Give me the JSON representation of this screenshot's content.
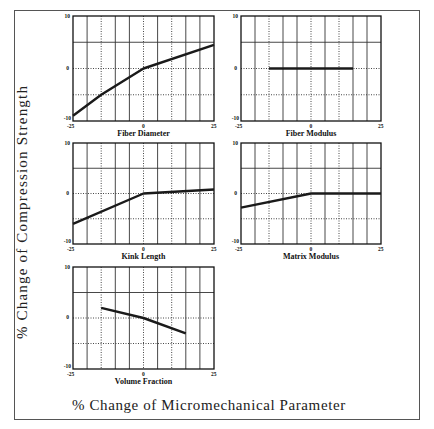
{
  "figure": {
    "ylabel": "% Change of Compression Strength",
    "xlabel": "% Change of Micromechanical Parameter"
  },
  "chart_data": {
    "type": "line",
    "title": "",
    "shared_ylabel": "% Change of Compression Strength",
    "shared_xlabel": "% Change of Micromechanical Parameter",
    "xlim": [
      -25,
      25
    ],
    "ylim": [
      -10,
      10
    ],
    "x_ticks": [
      "-25",
      "0",
      "25"
    ],
    "y_ticks": [
      "10",
      "0",
      "-10"
    ],
    "grid": true,
    "panels": [
      {
        "name": "Fiber Diameter",
        "x": [
          -25,
          -15,
          0,
          25
        ],
        "y": [
          -9,
          -5,
          0,
          4.5
        ]
      },
      {
        "name": "Fiber Modulus",
        "x": [
          -15,
          15
        ],
        "y": [
          0,
          0
        ]
      },
      {
        "name": "Kink Length",
        "x": [
          -25,
          0,
          25
        ],
        "y": [
          -6,
          0,
          0.8
        ]
      },
      {
        "name": "Matrix Modulus",
        "x": [
          -25,
          0,
          25
        ],
        "y": [
          -2.8,
          0,
          0
        ]
      },
      {
        "name": "Volume Fraction",
        "x": [
          -15,
          0,
          15
        ],
        "y": [
          2,
          0,
          -3
        ]
      }
    ]
  },
  "panels": [
    {
      "title": "Fiber Diameter",
      "left": 73,
      "top": 16,
      "w": 141,
      "h": 105
    },
    {
      "title": "Fiber Modulus",
      "left": 241,
      "top": 16,
      "w": 140,
      "h": 105
    },
    {
      "title": "Kink Length",
      "left": 73,
      "top": 143,
      "w": 141,
      "h": 101
    },
    {
      "title": "Matrix Modulus",
      "left": 241,
      "top": 143,
      "w": 140,
      "h": 101
    },
    {
      "title": "Volume Fraction",
      "left": 73,
      "top": 267,
      "w": 141,
      "h": 102
    }
  ],
  "ticks": {
    "ymax": "10",
    "ymid": "0",
    "ymin": "-10",
    "xmin": "-25",
    "xmid": "0",
    "xmax": "25"
  },
  "style": {
    "line_color": "#1a1a1a",
    "grid_color": "#333333",
    "frame_color": "#555555"
  }
}
